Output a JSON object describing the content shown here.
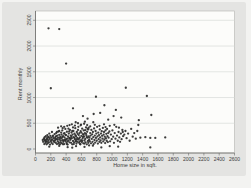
{
  "figure": {
    "xlabel": "Home size in sqft.",
    "ylabel": "Rent monthly"
  },
  "colors": {
    "page_bg": "#f3f3f1",
    "card_bg": "#e4e4e2",
    "plot_bg": "#fcfcfa",
    "grid": "#d9dbd8",
    "axis": "#6a6a68",
    "plot_border": "#b2b2b0",
    "marker": "#2d2d2b",
    "text": "#3b3b3b"
  },
  "chart_data": {
    "type": "scatter",
    "title": "",
    "xlabel": "Home size in sqft.",
    "ylabel": "Rent monthly",
    "xlim": [
      0,
      2600
    ],
    "ylim": [
      0,
      2500
    ],
    "x_ticks": [
      0,
      200,
      400,
      600,
      800,
      1000,
      1200,
      1400,
      1600,
      1800,
      2000,
      2200,
      2400,
      2600
    ],
    "y_ticks": [
      0,
      500,
      1000,
      1500,
      2000,
      2500
    ],
    "grid": "horizontal",
    "legend": "none",
    "marker_size": 1.15,
    "points": [
      [
        95,
        175
      ],
      [
        100,
        140
      ],
      [
        110,
        205
      ],
      [
        115,
        95
      ],
      [
        120,
        230
      ],
      [
        125,
        160
      ],
      [
        130,
        120
      ],
      [
        135,
        250
      ],
      [
        140,
        180
      ],
      [
        145,
        90
      ],
      [
        150,
        210
      ],
      [
        150,
        140
      ],
      [
        155,
        270
      ],
      [
        160,
        110
      ],
      [
        165,
        235
      ],
      [
        170,
        165
      ],
      [
        175,
        130
      ],
      [
        180,
        300
      ],
      [
        185,
        195
      ],
      [
        190,
        85
      ],
      [
        195,
        255
      ],
      [
        200,
        150
      ],
      [
        205,
        220
      ],
      [
        210,
        120
      ],
      [
        215,
        330
      ],
      [
        220,
        185
      ],
      [
        225,
        95
      ],
      [
        230,
        260
      ],
      [
        235,
        155
      ],
      [
        240,
        210
      ],
      [
        245,
        135
      ],
      [
        250,
        290
      ],
      [
        155,
        185
      ],
      [
        175,
        225
      ],
      [
        205,
        170
      ],
      [
        135,
        150
      ],
      [
        115,
        185
      ],
      [
        225,
        240
      ],
      [
        255,
        165
      ],
      [
        260,
        230
      ],
      [
        265,
        120
      ],
      [
        270,
        310
      ],
      [
        275,
        190
      ],
      [
        280,
        95
      ],
      [
        285,
        260
      ],
      [
        290,
        150
      ],
      [
        295,
        220
      ],
      [
        300,
        340
      ],
      [
        305,
        130
      ],
      [
        310,
        275
      ],
      [
        315,
        185
      ],
      [
        320,
        90
      ],
      [
        325,
        240
      ],
      [
        330,
        160
      ],
      [
        335,
        320
      ],
      [
        340,
        205
      ],
      [
        345,
        110
      ],
      [
        350,
        360
      ],
      [
        355,
        170
      ],
      [
        360,
        250
      ],
      [
        365,
        140
      ],
      [
        370,
        300
      ],
      [
        375,
        95
      ],
      [
        380,
        225
      ],
      [
        385,
        180
      ],
      [
        390,
        390
      ],
      [
        395,
        155
      ],
      [
        400,
        270
      ],
      [
        405,
        120
      ],
      [
        410,
        335
      ],
      [
        415,
        200
      ],
      [
        420,
        85
      ],
      [
        425,
        245
      ],
      [
        430,
        165
      ],
      [
        435,
        300
      ],
      [
        440,
        215
      ],
      [
        445,
        130
      ],
      [
        450,
        370
      ],
      [
        260,
        195
      ],
      [
        280,
        330
      ],
      [
        300,
        105
      ],
      [
        320,
        215
      ],
      [
        340,
        280
      ],
      [
        360,
        90
      ],
      [
        380,
        310
      ],
      [
        400,
        190
      ],
      [
        420,
        150
      ],
      [
        440,
        340
      ],
      [
        270,
        250
      ],
      [
        290,
        185
      ],
      [
        310,
        350
      ],
      [
        330,
        125
      ],
      [
        350,
        230
      ],
      [
        370,
        165
      ],
      [
        390,
        275
      ],
      [
        410,
        95
      ],
      [
        430,
        395
      ],
      [
        450,
        210
      ],
      [
        295,
        415
      ],
      [
        335,
        440
      ],
      [
        375,
        430
      ],
      [
        415,
        450
      ],
      [
        355,
        405
      ],
      [
        445,
        465
      ],
      [
        455,
        180
      ],
      [
        460,
        260
      ],
      [
        465,
        120
      ],
      [
        470,
        320
      ],
      [
        475,
        210
      ],
      [
        480,
        90
      ],
      [
        485,
        280
      ],
      [
        490,
        155
      ],
      [
        495,
        350
      ],
      [
        500,
        230
      ],
      [
        505,
        130
      ],
      [
        510,
        300
      ],
      [
        515,
        190
      ],
      [
        520,
        405
      ],
      [
        525,
        160
      ],
      [
        530,
        250
      ],
      [
        535,
        105
      ],
      [
        540,
        330
      ],
      [
        545,
        215
      ],
      [
        550,
        140
      ],
      [
        555,
        370
      ],
      [
        560,
        185
      ],
      [
        565,
        270
      ],
      [
        570,
        120
      ],
      [
        575,
        310
      ],
      [
        580,
        225
      ],
      [
        585,
        95
      ],
      [
        590,
        345
      ],
      [
        595,
        170
      ],
      [
        600,
        255
      ],
      [
        605,
        135
      ],
      [
        610,
        395
      ],
      [
        615,
        205
      ],
      [
        620,
        290
      ],
      [
        625,
        110
      ],
      [
        630,
        360
      ],
      [
        635,
        240
      ],
      [
        640,
        165
      ],
      [
        645,
        310
      ],
      [
        650,
        195
      ],
      [
        655,
        130
      ],
      [
        660,
        420
      ],
      [
        665,
        265
      ],
      [
        670,
        90
      ],
      [
        675,
        335
      ],
      [
        680,
        220
      ],
      [
        685,
        155
      ],
      [
        690,
        380
      ],
      [
        695,
        245
      ],
      [
        700,
        175
      ],
      [
        460,
        200
      ],
      [
        480,
        350
      ],
      [
        500,
        95
      ],
      [
        520,
        270
      ],
      [
        540,
        185
      ],
      [
        560,
        430
      ],
      [
        580,
        150
      ],
      [
        600,
        320
      ],
      [
        620,
        235
      ],
      [
        640,
        105
      ],
      [
        660,
        295
      ],
      [
        680,
        390
      ],
      [
        470,
        245
      ],
      [
        490,
        420
      ],
      [
        510,
        215
      ],
      [
        530,
        145
      ],
      [
        550,
        295
      ],
      [
        570,
        200
      ],
      [
        590,
        460
      ],
      [
        610,
        160
      ],
      [
        630,
        275
      ],
      [
        650,
        365
      ],
      [
        670,
        230
      ],
      [
        690,
        120
      ],
      [
        475,
        480
      ],
      [
        515,
        455
      ],
      [
        555,
        500
      ],
      [
        595,
        475
      ],
      [
        635,
        490
      ],
      [
        675,
        465
      ],
      [
        525,
        520
      ],
      [
        645,
        530
      ],
      [
        585,
        90
      ],
      [
        695,
        415
      ],
      [
        705,
        220
      ],
      [
        710,
        150
      ],
      [
        715,
        310
      ],
      [
        720,
        260
      ],
      [
        725,
        110
      ],
      [
        730,
        370
      ],
      [
        735,
        195
      ],
      [
        740,
        285
      ],
      [
        745,
        140
      ],
      [
        750,
        330
      ],
      [
        755,
        230
      ],
      [
        760,
        95
      ],
      [
        765,
        400
      ],
      [
        770,
        175
      ],
      [
        775,
        260
      ],
      [
        780,
        125
      ],
      [
        785,
        350
      ],
      [
        790,
        215
      ],
      [
        795,
        300
      ],
      [
        800,
        160
      ],
      [
        805,
        430
      ],
      [
        810,
        245
      ],
      [
        815,
        105
      ],
      [
        820,
        320
      ],
      [
        825,
        190
      ],
      [
        830,
        270
      ],
      [
        835,
        140
      ],
      [
        840,
        380
      ],
      [
        845,
        225
      ],
      [
        850,
        165
      ],
      [
        855,
        300
      ],
      [
        860,
        120
      ],
      [
        865,
        345
      ],
      [
        870,
        255
      ],
      [
        875,
        200
      ],
      [
        880,
        410
      ],
      [
        885,
        150
      ],
      [
        890,
        280
      ],
      [
        895,
        330
      ],
      [
        900,
        185
      ],
      [
        905,
        240
      ],
      [
        910,
        115
      ],
      [
        915,
        360
      ],
      [
        920,
        210
      ],
      [
        925,
        295
      ],
      [
        930,
        160
      ],
      [
        935,
        390
      ],
      [
        940,
        250
      ],
      [
        945,
        135
      ],
      [
        950,
        310
      ],
      [
        715,
        440
      ],
      [
        775,
        470
      ],
      [
        835,
        450
      ],
      [
        895,
        480
      ],
      [
        755,
        520
      ],
      [
        915,
        425
      ],
      [
        955,
        220
      ],
      [
        965,
        340
      ],
      [
        975,
        150
      ],
      [
        985,
        280
      ],
      [
        995,
        190
      ],
      [
        1005,
        360
      ],
      [
        1015,
        240
      ],
      [
        1025,
        120
      ],
      [
        1035,
        310
      ],
      [
        1045,
        200
      ],
      [
        1055,
        430
      ],
      [
        1065,
        260
      ],
      [
        1075,
        160
      ],
      [
        1085,
        330
      ],
      [
        1095,
        225
      ],
      [
        1105,
        140
      ],
      [
        1115,
        300
      ],
      [
        1125,
        190
      ],
      [
        1135,
        370
      ],
      [
        1145,
        250
      ],
      [
        970,
        450
      ],
      [
        1030,
        470
      ],
      [
        1090,
        415
      ],
      [
        1140,
        330
      ],
      [
        1160,
        280
      ],
      [
        1175,
        350
      ],
      [
        1190,
        210
      ],
      [
        1210,
        300
      ],
      [
        1230,
        160
      ],
      [
        1250,
        390
      ],
      [
        1270,
        240
      ],
      [
        1290,
        310
      ],
      [
        1310,
        200
      ],
      [
        1330,
        350
      ],
      [
        1370,
        220
      ],
      [
        1435,
        230
      ],
      [
        1500,
        215
      ],
      [
        1565,
        215
      ],
      [
        1695,
        225
      ],
      [
        1343,
        466
      ],
      [
        180,
        45
      ],
      [
        310,
        60
      ],
      [
        420,
        35
      ],
      [
        530,
        55
      ],
      [
        640,
        40
      ],
      [
        750,
        65
      ],
      [
        860,
        30
      ],
      [
        970,
        55
      ],
      [
        1080,
        45
      ],
      [
        480,
        25
      ],
      [
        700,
        70
      ],
      [
        1500,
        30
      ],
      [
        620,
        640
      ],
      [
        760,
        680
      ],
      [
        1020,
        640
      ],
      [
        680,
        590
      ],
      [
        950,
        570
      ],
      [
        1120,
        610
      ],
      [
        845,
        700
      ],
      [
        1350,
        560
      ],
      [
        490,
        790
      ],
      [
        900,
        850
      ],
      [
        1050,
        760
      ],
      [
        1513,
        660
      ],
      [
        790,
        1015
      ],
      [
        1455,
        1030
      ],
      [
        200,
        1180
      ],
      [
        1180,
        1190
      ],
      [
        400,
        1660
      ],
      [
        170,
        2345
      ],
      [
        310,
        2330
      ]
    ]
  }
}
